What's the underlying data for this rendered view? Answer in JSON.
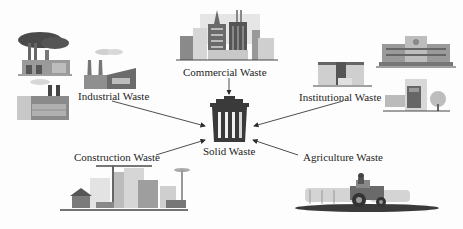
{
  "diagram": {
    "center": {
      "label": "Solid Waste",
      "icon": "trash-bin-icon"
    },
    "sources": [
      {
        "id": "industrial",
        "label": "Industrial Waste",
        "icon": "factory-icon"
      },
      {
        "id": "commercial",
        "label": "Commercial Waste",
        "icon": "city-buildings-icon"
      },
      {
        "id": "institutional",
        "label": "Institutional Waste",
        "icon": "institution-buildings-icon"
      },
      {
        "id": "construction",
        "label": "Construction Waste",
        "icon": "construction-site-icon"
      },
      {
        "id": "agriculture",
        "label": "Agriculture Waste",
        "icon": "tractor-icon"
      }
    ],
    "edges": [
      {
        "from": "industrial",
        "to": "center"
      },
      {
        "from": "commercial",
        "to": "center"
      },
      {
        "from": "institutional",
        "to": "center"
      },
      {
        "from": "construction",
        "to": "center"
      },
      {
        "from": "agriculture",
        "to": "center"
      }
    ],
    "colors": {
      "ink": "#2a2a2a",
      "bin": "#3a3a3a",
      "building": "#8a8a8a",
      "light": "#cfcfcf",
      "background": "#fdfdfd"
    }
  }
}
